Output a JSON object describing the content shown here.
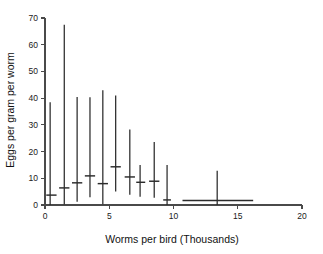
{
  "chart_data": {
    "type": "scatter",
    "title": "",
    "xlabel": "Worms per bird (Thousands)",
    "ylabel": "Eggs per gram per worm",
    "xlim": [
      0,
      20
    ],
    "ylim": [
      0,
      70
    ],
    "xticks": [
      0,
      5,
      10,
      15,
      20
    ],
    "yticks": [
      0,
      10,
      20,
      30,
      40,
      50,
      60,
      70
    ],
    "grid": false,
    "legend": "none",
    "points": [
      {
        "x": 0.4,
        "mean": 3.7,
        "low": 0.0,
        "high": 38.5,
        "span_low": 0.1,
        "span_high": 0.9
      },
      {
        "x": 1.5,
        "mean": 6.4,
        "low": 0.2,
        "high": 67.5,
        "span_low": 1.1,
        "span_high": 1.9
      },
      {
        "x": 2.5,
        "mean": 8.3,
        "low": 1.2,
        "high": 40.4,
        "span_low": 2.1,
        "span_high": 2.9
      },
      {
        "x": 3.5,
        "mean": 10.9,
        "low": 2.9,
        "high": 40.3,
        "span_low": 3.1,
        "span_high": 3.9
      },
      {
        "x": 4.5,
        "mean": 8.0,
        "low": 0.3,
        "high": 43.0,
        "span_low": 4.1,
        "span_high": 4.9
      },
      {
        "x": 5.5,
        "mean": 14.3,
        "low": 5.1,
        "high": 41.0,
        "span_low": 5.1,
        "span_high": 5.9
      },
      {
        "x": 6.6,
        "mean": 10.5,
        "low": 3.8,
        "high": 28.3,
        "span_low": 6.2,
        "span_high": 7.0
      },
      {
        "x": 7.4,
        "mean": 8.5,
        "low": 3.1,
        "high": 15.0,
        "span_low": 7.1,
        "span_high": 7.8
      },
      {
        "x": 8.5,
        "mean": 8.9,
        "low": 2.7,
        "high": 23.6,
        "span_low": 8.1,
        "span_high": 8.9
      },
      {
        "x": 9.5,
        "mean": 1.9,
        "low": 0.0,
        "high": 15.0,
        "span_low": 9.2,
        "span_high": 9.8
      },
      {
        "x": 13.4,
        "mean": 1.7,
        "low": 0.0,
        "high": 12.8,
        "span_low": 10.7,
        "span_high": 16.2
      }
    ]
  },
  "figure": {
    "background_color": "#ffffff",
    "line_color": "#2b2b2b",
    "axis_color": "#4a4a4a"
  }
}
